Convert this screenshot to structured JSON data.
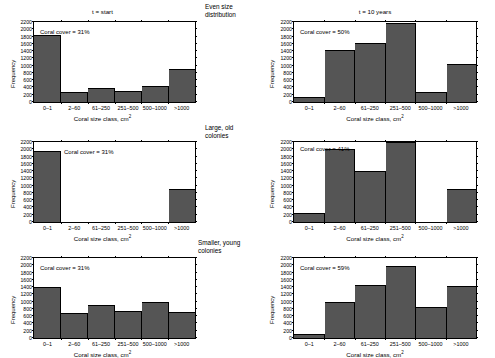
{
  "figure": {
    "column_titles": [
      "t = start",
      "t = 10 years"
    ],
    "row_labels": [
      "Even size\ndistribution",
      "Large, old\ncolonies",
      "Smaller, young\ncolonies"
    ],
    "row_labels_lines": [
      [
        "Even size",
        "distribution"
      ],
      [
        "Large, old",
        "colonies"
      ],
      [
        "Smaller, young",
        "colonies"
      ]
    ],
    "bar_color": "#555555",
    "axis_color": "#000000",
    "background": "#ffffff"
  },
  "chart_data": [
    {
      "type": "bar",
      "panel": "top-left",
      "title": "t = start",
      "annotation": "Coral cover = 31%",
      "categories": [
        "0–1",
        "2–60",
        "61–250",
        "251–500",
        "500–1000",
        ">1000"
      ],
      "values": [
        1830,
        280,
        390,
        310,
        430,
        920
      ],
      "xlabel": "Coral size class, cm2",
      "ylabel": "Frequency",
      "ylim": [
        0,
        2200
      ],
      "yticks": [
        0,
        200,
        400,
        600,
        800,
        1000,
        1200,
        1400,
        1600,
        1800,
        2000,
        2200
      ],
      "grid": false
    },
    {
      "type": "bar",
      "panel": "top-right",
      "title": "t = 10 years",
      "annotation": "Coral cover = 50%",
      "categories": [
        "0–1",
        "2–60",
        "61–250",
        "251–500",
        "500–1000",
        ">1000"
      ],
      "values": [
        140,
        1430,
        1620,
        2160,
        280,
        1040
      ],
      "xlabel": "Coral size class, cm2",
      "ylabel": "Frequency",
      "ylim": [
        0,
        2200
      ],
      "yticks": [
        0,
        200,
        400,
        600,
        800,
        1000,
        1200,
        1400,
        1600,
        1800,
        2000,
        2200
      ],
      "grid": false
    },
    {
      "type": "bar",
      "panel": "middle-left",
      "title": "",
      "annotation": "Coral cover = 31%",
      "categories": [
        "0–1",
        "2–60",
        "61–250",
        "251–500",
        "500–1000",
        ">1000"
      ],
      "values": [
        1950,
        0,
        0,
        0,
        0,
        900
      ],
      "xlabel": "Coral size class, cm2",
      "ylabel": "Frequency",
      "ylim": [
        0,
        2200
      ],
      "yticks": [
        0,
        200,
        400,
        600,
        800,
        1000,
        1200,
        1400,
        1600,
        1800,
        2000,
        2200
      ],
      "grid": false
    },
    {
      "type": "bar",
      "panel": "middle-right",
      "title": "",
      "annotation": "Coral cover = 41%",
      "categories": [
        "0–1",
        "2–60",
        "61–250",
        "251–500",
        "500–1000",
        ">1000"
      ],
      "values": [
        250,
        2000,
        1400,
        2200,
        0,
        900
      ],
      "xlabel": "Coral size class, cm2",
      "ylabel": "Frequency",
      "ylim": [
        0,
        2200
      ],
      "yticks": [
        0,
        200,
        400,
        600,
        800,
        1000,
        1200,
        1400,
        1600,
        1800,
        2000,
        2200
      ],
      "grid": false
    },
    {
      "type": "bar",
      "panel": "bottom-left",
      "title": "",
      "annotation": "Coral cover = 31%",
      "categories": [
        "0–1",
        "2–60",
        "61–250",
        "251–500",
        "500–1000",
        ">1000"
      ],
      "values": [
        1400,
        700,
        920,
        750,
        1000,
        720
      ],
      "xlabel": "Coral size class, cm2",
      "ylabel": "Frequency",
      "ylim": [
        0,
        2200
      ],
      "yticks": [
        0,
        200,
        400,
        600,
        800,
        1000,
        1200,
        1400,
        1600,
        1800,
        2000,
        2200
      ],
      "grid": false
    },
    {
      "type": "bar",
      "panel": "bottom-right",
      "title": "",
      "annotation": "Coral cover = 59%",
      "categories": [
        "0–1",
        "2–60",
        "61–250",
        "251–500",
        "500–1000",
        ">1000"
      ],
      "values": [
        100,
        980,
        1470,
        1970,
        850,
        1420
      ],
      "xlabel": "Coral size class, cm2",
      "ylabel": "Frequency",
      "ylim": [
        0,
        2200
      ],
      "yticks": [
        0,
        200,
        400,
        600,
        800,
        1000,
        1200,
        1400,
        1600,
        1800,
        2000,
        2200
      ],
      "grid": false
    }
  ],
  "labels": {
    "xlabel_main": "Coral size class, cm",
    "xlabel_sup": "2",
    "ylabel": "Frequency"
  }
}
